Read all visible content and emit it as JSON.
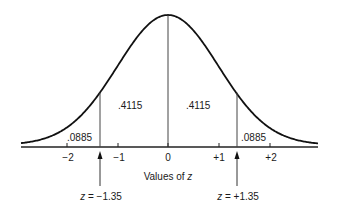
{
  "diagram": {
    "type": "normal-distribution-curve",
    "axis": {
      "label_prefix": "Values of ",
      "label_var": "z",
      "ticks": [
        {
          "value": -2,
          "label": "−2"
        },
        {
          "value": -1,
          "label": "−1"
        },
        {
          "value": 0,
          "label": "0"
        },
        {
          "value": 1,
          "label": "+1"
        },
        {
          "value": 2,
          "label": "+2"
        }
      ]
    },
    "regions": {
      "left_tail": ".0885",
      "left_center": ".4115",
      "right_center": ".4115",
      "right_tail": ".0885"
    },
    "markers": [
      {
        "var": "z",
        "eq": " = ",
        "value": "−1.35",
        "z": -1.35
      },
      {
        "var": "z",
        "eq": " = ",
        "value": "+1.35",
        "z": 1.35
      }
    ],
    "colors": {
      "curve": "#111111",
      "lines": "#333333",
      "background": "#ffffff"
    }
  }
}
